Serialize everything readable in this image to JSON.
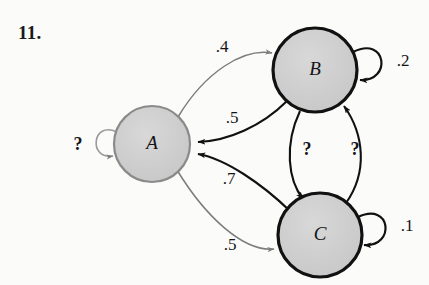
{
  "problem": {
    "number": "11."
  },
  "diagram": {
    "type": "state-transition-diagram",
    "colors": {
      "background": "#fbfbf9",
      "node_fill": "#cfcfcf",
      "node_stroke_dark": "#111111",
      "node_stroke_light": "#8a8a8a",
      "edge_dark": "#111111",
      "edge_light": "#7d7d7d",
      "text": "#141416"
    },
    "nodes": [
      {
        "id": "A",
        "label": "A",
        "cx": 152,
        "cy": 144,
        "r": 38,
        "stroke": "light"
      },
      {
        "id": "B",
        "label": "B",
        "cx": 315,
        "cy": 70,
        "r": 42,
        "stroke": "dark"
      },
      {
        "id": "C",
        "label": "C",
        "cx": 320,
        "cy": 235,
        "r": 42,
        "stroke": "dark"
      }
    ],
    "edges": [
      {
        "from": "A",
        "to": "B",
        "label": ".4",
        "style": "light",
        "label_x": 222,
        "label_y": 48
      },
      {
        "from": "B",
        "to": "A",
        "label": ".5",
        "style": "dark",
        "label_x": 232,
        "label_y": 119
      },
      {
        "from": "C",
        "to": "A",
        "label": ".7",
        "style": "dark",
        "label_x": 229,
        "label_y": 180
      },
      {
        "from": "A",
        "to": "C",
        "label": ".5",
        "style": "light",
        "label_x": 230,
        "label_y": 246
      },
      {
        "from": "B",
        "to": "C",
        "label": "?",
        "style": "dark",
        "label_x": 307,
        "label_y": 151
      },
      {
        "from": "C",
        "to": "B",
        "label": "?",
        "style": "dark",
        "label_x": 355,
        "label_y": 151
      },
      {
        "from": "A",
        "to": "A",
        "label": "?",
        "style": "light",
        "label_x": 78,
        "label_y": 146,
        "kind": "self-loop"
      },
      {
        "from": "B",
        "to": "B",
        "label": ".2",
        "style": "dark",
        "label_x": 403,
        "label_y": 62,
        "kind": "self-loop"
      },
      {
        "from": "C",
        "to": "C",
        "label": ".1",
        "style": "dark",
        "label_x": 407,
        "label_y": 227,
        "kind": "self-loop"
      }
    ]
  }
}
